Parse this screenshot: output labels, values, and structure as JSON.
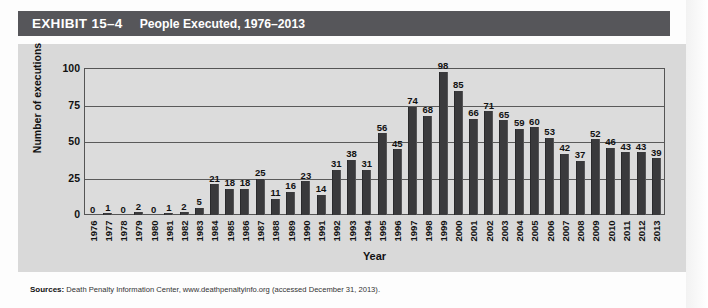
{
  "header": {
    "exhibit_number": "EXHIBIT 15–4",
    "title": "People Executed, 1976–2013",
    "bar_color": "#56565a"
  },
  "source": {
    "label": "Sources:",
    "text": "Death Penalty Information Center, www.deathpenaltyinfo.org (accessed December 31, 2013)."
  },
  "chart_data": {
    "type": "bar",
    "title": "People Executed, 1976–2013",
    "xlabel": "Year",
    "ylabel": "Number of executions",
    "ylim": [
      0,
      100
    ],
    "yticks": [
      "0",
      "25",
      "50",
      "75",
      "100"
    ],
    "grid": true,
    "legend": "none",
    "bar_color": "#3a3a3c",
    "plot_background": "#dcdcdc",
    "categories": [
      "1976",
      "1977",
      "1978",
      "1979",
      "1980",
      "1981",
      "1982",
      "1983",
      "1984",
      "1985",
      "1986",
      "1987",
      "1988",
      "1989",
      "1990",
      "1991",
      "1992",
      "1993",
      "1994",
      "1995",
      "1996",
      "1997",
      "1998",
      "1999",
      "2000",
      "2001",
      "2002",
      "2003",
      "2004",
      "2005",
      "2006",
      "2007",
      "2008",
      "2009",
      "2010",
      "2011",
      "2012",
      "2013"
    ],
    "values": [
      0,
      1,
      0,
      2,
      0,
      1,
      2,
      5,
      21,
      18,
      18,
      25,
      11,
      16,
      23,
      14,
      31,
      38,
      31,
      56,
      45,
      74,
      68,
      98,
      85,
      66,
      71,
      65,
      59,
      60,
      53,
      42,
      37,
      52,
      46,
      43,
      43,
      39
    ]
  }
}
